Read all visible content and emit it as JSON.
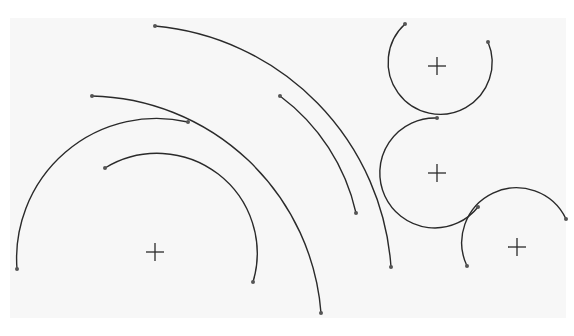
{
  "diagram": {
    "colors": {
      "background": "#ffffff",
      "panel": "#f7f7f7",
      "stroke": "#2a2a2a",
      "endpoint": "#555555"
    },
    "panel": {
      "x": 10,
      "y": 18,
      "width": 556,
      "height": 300
    },
    "centers": [
      {
        "id": "A",
        "x": 155,
        "y": 252
      },
      {
        "id": "B",
        "x": 437,
        "y": 66
      },
      {
        "id": "C",
        "x": 437,
        "y": 173
      },
      {
        "id": "D",
        "x": 517,
        "y": 247
      }
    ],
    "arcs": [
      {
        "id": "arc-1",
        "d": "M105,168 A100,100 0 0 1 253,282",
        "start": [
          105,
          168
        ],
        "end": [
          253,
          282
        ]
      },
      {
        "id": "arc-2",
        "d": "M17,269 A140,140 0 0 1 188,122",
        "start": [
          17,
          269
        ],
        "end": [
          188,
          122
        ]
      },
      {
        "id": "arc-3",
        "d": "M92,96 A235,235 0 0 1 321,313",
        "start": [
          92,
          96
        ],
        "end": [
          321,
          313
        ]
      },
      {
        "id": "arc-4",
        "d": "M155,26 A260,260 0 0 1 391,267",
        "start": [
          155,
          26
        ],
        "end": [
          391,
          267
        ]
      },
      {
        "id": "arc-5",
        "d": "M280,96 A200,200 0 0 1 356,213",
        "start": [
          280,
          96
        ],
        "end": [
          356,
          213
        ]
      },
      {
        "id": "arc-circle-b",
        "d": "M405,24 A52,52 0 1 0 488,42",
        "start": [
          405,
          24
        ],
        "end": [
          488,
          42
        ]
      },
      {
        "id": "arc-circle-c",
        "d": "M437,118 A55,55 0 1 0 478,207",
        "start": [
          437,
          118
        ],
        "end": [
          478,
          207
        ]
      },
      {
        "id": "arc-circle-d",
        "d": "M467,266 A52,52 0 0 1 566,219",
        "start": [
          467,
          266
        ],
        "end": [
          566,
          219
        ]
      }
    ]
  }
}
